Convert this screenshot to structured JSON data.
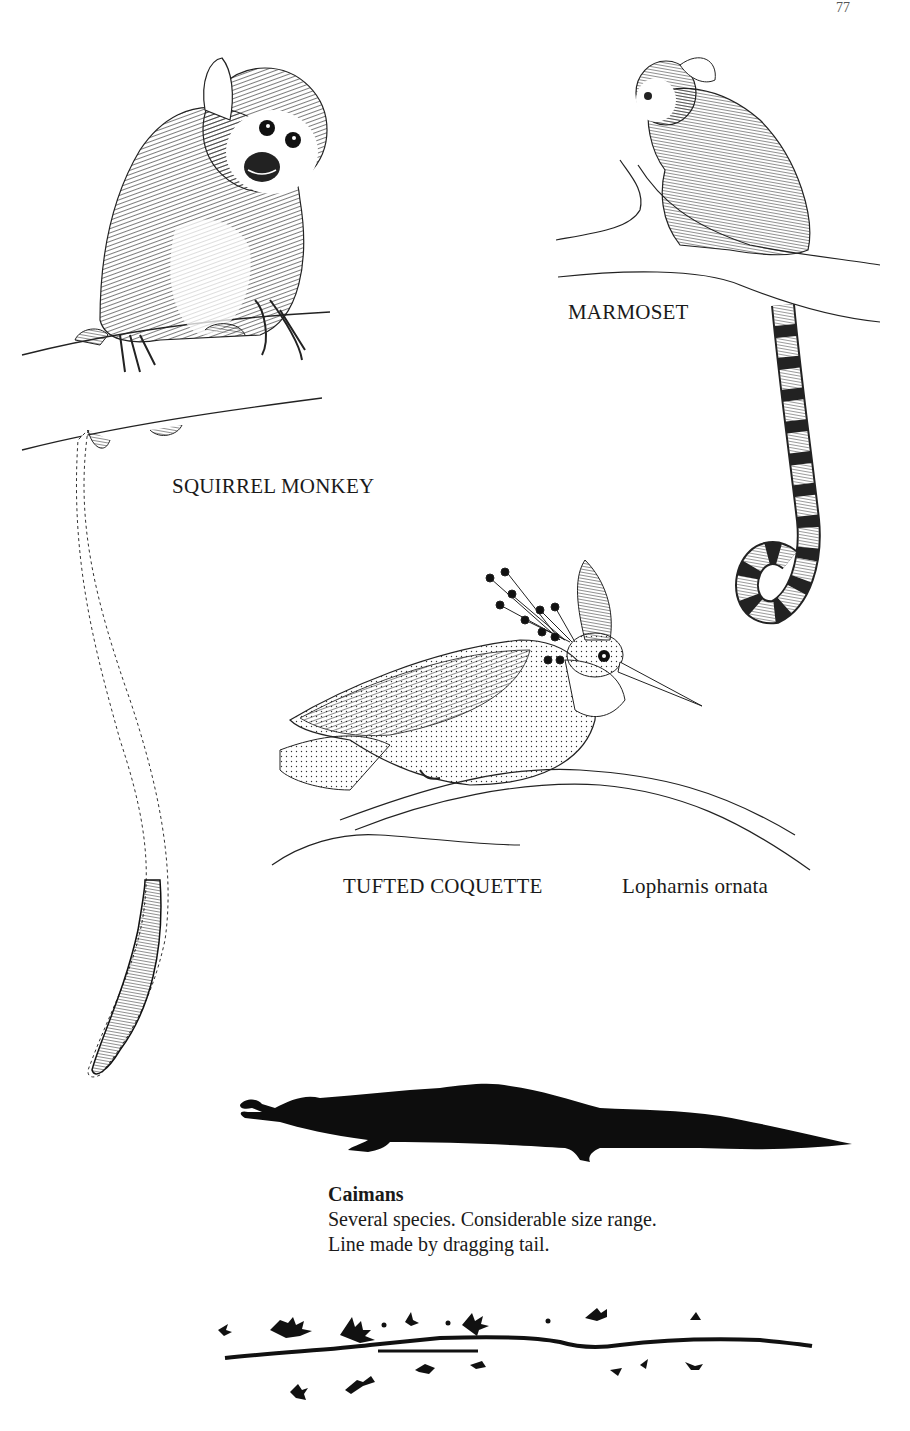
{
  "page": {
    "page_number": "77",
    "background": "#ffffff",
    "ink_color": "#111111"
  },
  "illustrations": [
    {
      "id": "squirrel-monkey",
      "label": "SQUIRREL MONKEY"
    },
    {
      "id": "marmoset",
      "label": "MARMOSET"
    },
    {
      "id": "tufted-coquette",
      "label": "TUFTED COQUETTE",
      "scientific_name": "Lopharnis ornata"
    },
    {
      "id": "caiman",
      "label": "Caimans"
    }
  ],
  "caiman_caption": {
    "title": "Caimans",
    "lines": [
      "Several species. Considerable size range.",
      "Line made by dragging tail."
    ]
  }
}
